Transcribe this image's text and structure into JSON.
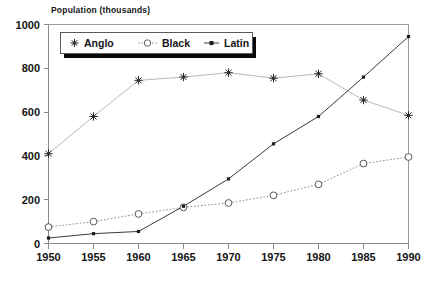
{
  "chart_data": {
    "type": "line",
    "title": "Population (thousands)",
    "xlabel": "",
    "ylabel": "",
    "x": [
      1950,
      1955,
      1960,
      1965,
      1970,
      1975,
      1980,
      1985,
      1990
    ],
    "categories": [
      "1950",
      "1955",
      "1960",
      "1965",
      "1970",
      "1975",
      "1980",
      "1985",
      "1990"
    ],
    "series": [
      {
        "name": "Anglo",
        "marker": "star",
        "linestyle": "solid",
        "color": "#b9b9b9",
        "values": [
          410,
          580,
          745,
          760,
          780,
          755,
          775,
          655,
          585
        ]
      },
      {
        "name": "Black",
        "marker": "open-circle",
        "linestyle": "dotted",
        "color": "#8c8c8c",
        "values": [
          75,
          100,
          135,
          165,
          185,
          220,
          270,
          365,
          395
        ]
      },
      {
        "name": "Latin",
        "marker": "filled-square",
        "linestyle": "solid",
        "color": "#3a3a3a",
        "values": [
          25,
          45,
          55,
          170,
          295,
          455,
          580,
          760,
          945
        ]
      }
    ],
    "ylim": [
      0,
      1000
    ],
    "xlim": [
      1950,
      1990
    ],
    "yticks": [
      0,
      200,
      400,
      600,
      800,
      1000
    ],
    "ytick_labels": [
      "0",
      "200",
      "400",
      "600",
      "800",
      "1000"
    ],
    "xticks": [
      1950,
      1955,
      1960,
      1965,
      1970,
      1975,
      1980,
      1985,
      1990
    ],
    "xtick_labels": [
      "1950",
      "1955",
      "1960",
      "1965",
      "1970",
      "1975",
      "1980",
      "1985",
      "1990"
    ],
    "grid": false,
    "legend_position": "top-center",
    "legend_entries": [
      "Anglo",
      "Black",
      "Latin"
    ]
  },
  "axis": {
    "y_labels": [
      "1000",
      "800",
      "600",
      "400",
      "200",
      "0"
    ],
    "x_labels": [
      "1950",
      "1955",
      "1960",
      "1965",
      "1970",
      "1975",
      "1980",
      "1985",
      "1990"
    ]
  },
  "legend": {
    "items": [
      {
        "label": "Anglo",
        "marker": "star-icon"
      },
      {
        "label": "Black",
        "marker": "open-circle-icon"
      },
      {
        "label": "Latin",
        "marker": "filled-square-icon"
      }
    ]
  },
  "title": {
    "text": "Population (thousands)"
  }
}
